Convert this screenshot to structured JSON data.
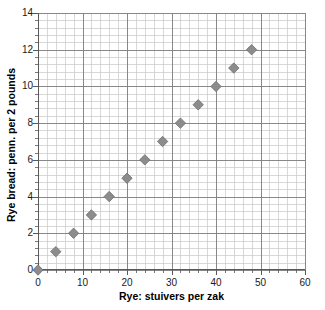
{
  "chart_data": {
    "type": "scatter",
    "title": "",
    "xlabel": "Rye: stuivers per zak",
    "ylabel": "Rye bread: penn. per 2 pounds",
    "xlim": [
      0,
      60
    ],
    "ylim": [
      0,
      14
    ],
    "xticks": [
      0,
      10,
      20,
      30,
      40,
      50,
      60
    ],
    "yticks": [
      0,
      2,
      4,
      6,
      8,
      10,
      12,
      14
    ],
    "xtick_labels": [
      "0",
      "10",
      "20",
      "30",
      "40",
      "50",
      "60"
    ],
    "ytick_labels": [
      "0",
      "2",
      "4",
      "6",
      "8",
      "10",
      "12",
      "14"
    ],
    "x_minor_step": 2,
    "y_minor_step": 0.4,
    "grid": true,
    "grid_minor": true,
    "legend": false,
    "legend_position": "none",
    "marker": "diamond",
    "marker_color": "#8c8c8c",
    "marker_edge_color": "#6e6e6e",
    "grid_major_color": "#808080",
    "grid_minor_color": "#c8c8c8",
    "axis_color": "#595959",
    "series": [
      {
        "name": "Rye bread price vs rye price",
        "x": [
          0,
          4,
          8,
          12,
          16,
          20,
          24,
          28,
          32,
          36,
          40,
          44,
          48
        ],
        "y": [
          0,
          1,
          2,
          3,
          4,
          5,
          6,
          7,
          8,
          9,
          10,
          11,
          12
        ]
      }
    ],
    "points": [
      {
        "x": 0,
        "y": 0
      },
      {
        "x": 4,
        "y": 1
      },
      {
        "x": 8,
        "y": 2
      },
      {
        "x": 12,
        "y": 3
      },
      {
        "x": 16,
        "y": 4
      },
      {
        "x": 20,
        "y": 5
      },
      {
        "x": 24,
        "y": 6
      },
      {
        "x": 28,
        "y": 7
      },
      {
        "x": 32,
        "y": 8
      },
      {
        "x": 36,
        "y": 9
      },
      {
        "x": 40,
        "y": 10
      },
      {
        "x": 44,
        "y": 11
      },
      {
        "x": 48,
        "y": 12
      }
    ]
  }
}
